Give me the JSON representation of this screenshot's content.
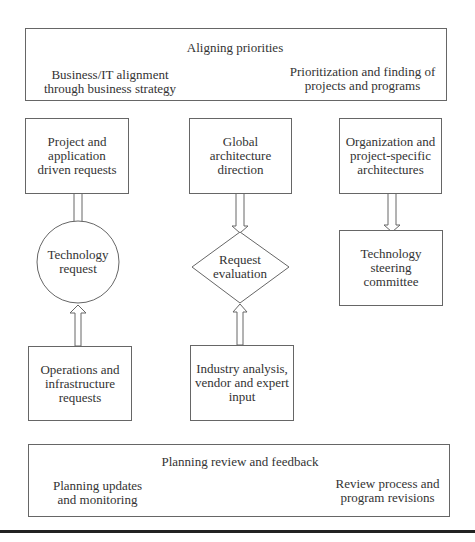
{
  "top_panel": {
    "title": "Aligning priorities",
    "left": "Business/IT alignment\nthrough business strategy",
    "right": "Prioritization and finding of\nprojects and programs"
  },
  "column_left": {
    "source_top": "Project and\napplication\ndriven requests",
    "hub": "Technology\nrequest",
    "source_bottom": "Operations and\ninfrastructure\nrequests"
  },
  "column_middle": {
    "source_top": "Global\narchitecture\ndirection",
    "hub": "Request\nevaluation",
    "source_bottom": "Industry analysis,\nvendor and expert\ninput"
  },
  "column_right": {
    "source_top": "Organization and\nproject-specific\narchitectures",
    "target": "Technology\nsteering\ncommittee"
  },
  "bottom_panel": {
    "title": "Planning review and feedback",
    "left": "Planning updates\nand monitoring",
    "right": "Review process and\nprogram revisions"
  }
}
